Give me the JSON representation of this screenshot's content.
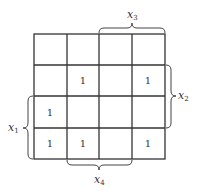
{
  "kmap": {
    "rows": 4,
    "cols": 4,
    "cells": [
      [
        "",
        "",
        "",
        ""
      ],
      [
        "",
        "1",
        "",
        "1"
      ],
      [
        "1",
        "",
        "",
        ""
      ],
      [
        "1",
        "1",
        "",
        "1"
      ]
    ],
    "labels": {
      "x1": {
        "base": "x",
        "sub": "1",
        "side": "left",
        "span": "rows 3-4"
      },
      "x2": {
        "base": "x",
        "sub": "2",
        "side": "right",
        "span": "rows 2-3"
      },
      "x3": {
        "base": "x",
        "sub": "3",
        "side": "top",
        "span": "cols 3-4"
      },
      "x4": {
        "base": "x",
        "sub": "4",
        "side": "bottom",
        "span": "cols 2-3"
      }
    }
  }
}
